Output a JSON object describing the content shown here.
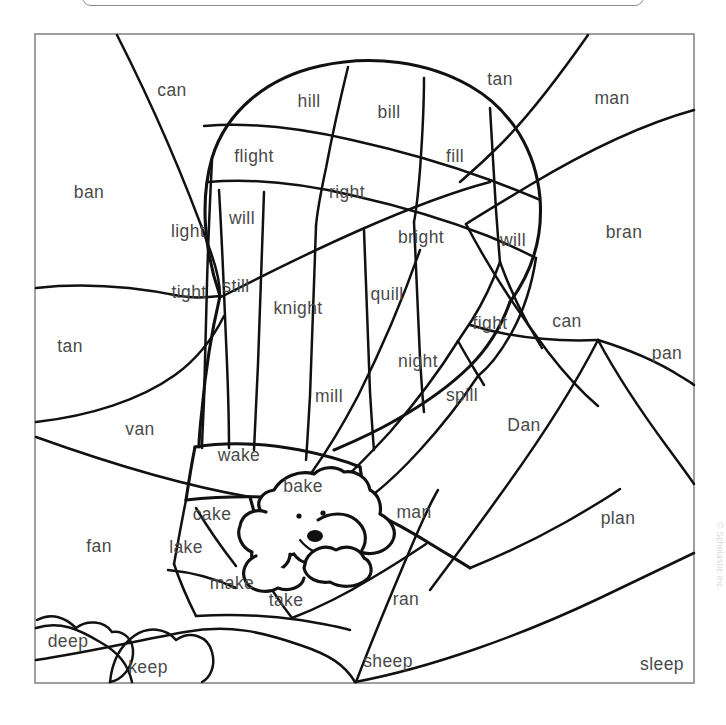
{
  "document": {
    "kind": "color-by-word worksheet",
    "title": "Hot Air Balloon Word Family Coloring Page",
    "copyright": "© Scholastic Inc.",
    "ink_color": "#111111",
    "word_color": "#4a4a4a",
    "frame_color": "#8f8f93",
    "background_color": "#ffffff"
  },
  "artwork": {
    "scene_label": "hot-air-balloon-scene",
    "subject_label": "puppy-in-basket",
    "regions_total": 44
  },
  "words": [
    {
      "id": "w01",
      "text": "can",
      "x": 172,
      "y": 91,
      "group": "an"
    },
    {
      "id": "w02",
      "text": "hill",
      "x": 309,
      "y": 102,
      "group": "ill"
    },
    {
      "id": "w03",
      "text": "bill",
      "x": 389,
      "y": 113,
      "group": "ill"
    },
    {
      "id": "w04",
      "text": "tan",
      "x": 500,
      "y": 80,
      "group": "an"
    },
    {
      "id": "w05",
      "text": "man",
      "x": 612,
      "y": 99,
      "group": "an"
    },
    {
      "id": "w06",
      "text": "flight",
      "x": 254,
      "y": 157,
      "group": "ight"
    },
    {
      "id": "w07",
      "text": "fill",
      "x": 455,
      "y": 157,
      "group": "ill"
    },
    {
      "id": "w08",
      "text": "ban",
      "x": 89,
      "y": 193,
      "group": "an"
    },
    {
      "id": "w09",
      "text": "right",
      "x": 347,
      "y": 193,
      "group": "ight"
    },
    {
      "id": "w10",
      "text": "will",
      "x": 242,
      "y": 219,
      "group": "ill"
    },
    {
      "id": "w11",
      "text": "light",
      "x": 188,
      "y": 232,
      "group": "ight"
    },
    {
      "id": "w12",
      "text": "bright",
      "x": 421,
      "y": 238,
      "group": "ight"
    },
    {
      "id": "w13",
      "text": "will",
      "x": 513,
      "y": 241,
      "group": "ill"
    },
    {
      "id": "w14",
      "text": "bran",
      "x": 624,
      "y": 233,
      "group": "an"
    },
    {
      "id": "w15",
      "text": "still",
      "x": 236,
      "y": 287,
      "group": "ill"
    },
    {
      "id": "w16",
      "text": "tight",
      "x": 189,
      "y": 293,
      "group": "ight"
    },
    {
      "id": "w17",
      "text": "quill",
      "x": 387,
      "y": 295,
      "group": "ill"
    },
    {
      "id": "w18",
      "text": "knight",
      "x": 298,
      "y": 309,
      "group": "ight"
    },
    {
      "id": "w19",
      "text": "fight",
      "x": 490,
      "y": 324,
      "group": "ight"
    },
    {
      "id": "w20",
      "text": "can",
      "x": 567,
      "y": 322,
      "group": "an"
    },
    {
      "id": "w21",
      "text": "tan",
      "x": 70,
      "y": 347,
      "group": "an"
    },
    {
      "id": "w22",
      "text": "pan",
      "x": 667,
      "y": 354,
      "group": "an"
    },
    {
      "id": "w23",
      "text": "night",
      "x": 418,
      "y": 362,
      "group": "ight"
    },
    {
      "id": "w24",
      "text": "mill",
      "x": 329,
      "y": 397,
      "group": "ill"
    },
    {
      "id": "w25",
      "text": "spill",
      "x": 462,
      "y": 396,
      "group": "ill"
    },
    {
      "id": "w26",
      "text": "van",
      "x": 140,
      "y": 430,
      "group": "an"
    },
    {
      "id": "w27",
      "text": "Dan",
      "x": 524,
      "y": 426,
      "group": "an"
    },
    {
      "id": "w28",
      "text": "wake",
      "x": 239,
      "y": 456,
      "group": "ake"
    },
    {
      "id": "w29",
      "text": "bake",
      "x": 303,
      "y": 487,
      "group": "ake"
    },
    {
      "id": "w30",
      "text": "cake",
      "x": 212,
      "y": 515,
      "group": "ake"
    },
    {
      "id": "w31",
      "text": "man",
      "x": 414,
      "y": 513,
      "group": "an"
    },
    {
      "id": "w32",
      "text": "plan",
      "x": 618,
      "y": 519,
      "group": "an"
    },
    {
      "id": "w33",
      "text": "lake",
      "x": 186,
      "y": 548,
      "group": "ake"
    },
    {
      "id": "w34",
      "text": "fan",
      "x": 99,
      "y": 547,
      "group": "an"
    },
    {
      "id": "w35",
      "text": "make",
      "x": 232,
      "y": 584,
      "group": "ake"
    },
    {
      "id": "w36",
      "text": "take",
      "x": 286,
      "y": 601,
      "group": "ake"
    },
    {
      "id": "w37",
      "text": "ran",
      "x": 406,
      "y": 600,
      "group": "an"
    },
    {
      "id": "w38",
      "text": "deep",
      "x": 68,
      "y": 642,
      "group": "eep"
    },
    {
      "id": "w39",
      "text": "keep",
      "x": 148,
      "y": 668,
      "group": "eep"
    },
    {
      "id": "w40",
      "text": "sheep",
      "x": 388,
      "y": 662,
      "group": "eep"
    },
    {
      "id": "w41",
      "text": "sleep",
      "x": 662,
      "y": 665,
      "group": "eep"
    }
  ],
  "word_families": [
    "ight",
    "ill",
    "an",
    "ake",
    "eep"
  ],
  "frame": {
    "x": 35,
    "y": 34,
    "width": 659,
    "height": 649
  }
}
